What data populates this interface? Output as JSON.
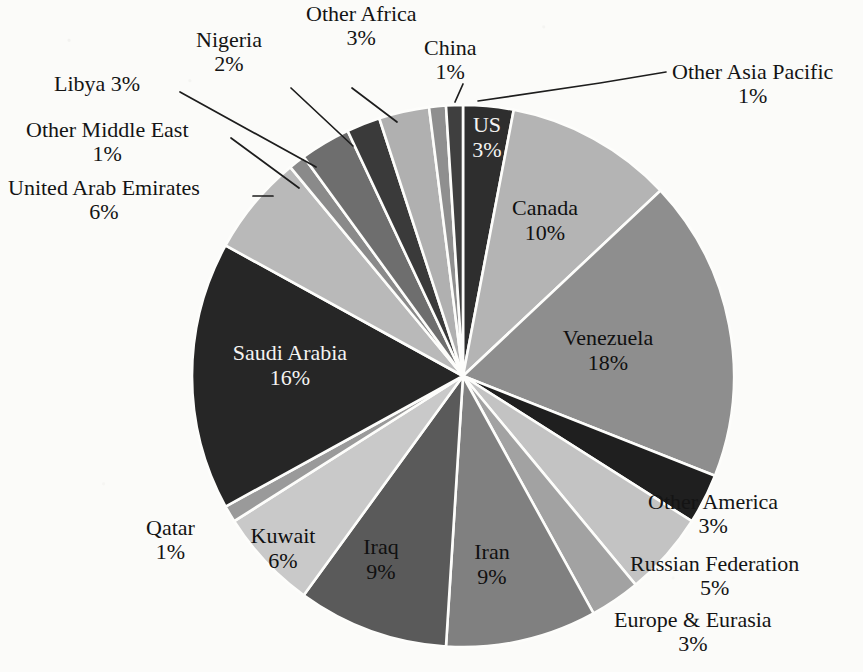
{
  "chart_data": {
    "type": "pie",
    "title": "",
    "subtitle": "",
    "units": "percent of total proved oil reserves",
    "legend_position": "none",
    "grid": false,
    "total": 100,
    "start_angle_deg": 0,
    "direction": "clockwise",
    "categories": [
      "US",
      "Canada",
      "Venezuela",
      "Other America",
      "Russian Federation",
      "Europe & Eurasia",
      "Iran",
      "Iraq",
      "Kuwait",
      "Qatar",
      "Saudi Arabia",
      "United Arab Emirates",
      "Other Middle East",
      "Libya",
      "Nigeria",
      "Other Africa",
      "China",
      "Other Asia Pacific"
    ],
    "values": [
      3,
      10,
      18,
      3,
      5,
      3,
      9,
      9,
      6,
      1,
      16,
      6,
      1,
      3,
      2,
      3,
      1,
      1
    ],
    "slices": [
      {
        "name": "US",
        "label": "US",
        "pct": 3,
        "pct_text": "3%",
        "color": "#2e2e2e",
        "label_placement": "inside",
        "text_color": "light"
      },
      {
        "name": "Canada",
        "label": "Canada",
        "pct": 10,
        "pct_text": "10%",
        "color": "#b4b4b4",
        "label_placement": "inside",
        "text_color": "dark"
      },
      {
        "name": "Venezuela",
        "label": "Venezuela",
        "pct": 18,
        "pct_text": "18%",
        "color": "#8e8e8e",
        "label_placement": "inside",
        "text_color": "dark"
      },
      {
        "name": "Other America",
        "label": "Other America",
        "pct": 3,
        "pct_text": "3%",
        "color": "#1f1f1f",
        "label_placement": "outside",
        "text_color": "dark"
      },
      {
        "name": "Russian Federation",
        "label": "Russian Federation",
        "pct": 5,
        "pct_text": "5%",
        "color": "#c3c3c3",
        "label_placement": "outside",
        "text_color": "dark"
      },
      {
        "name": "Europe & Eurasia",
        "label": "Europe & Eurasia",
        "pct": 3,
        "pct_text": "3%",
        "color": "#a2a2a2",
        "label_placement": "outside",
        "text_color": "dark"
      },
      {
        "name": "Iran",
        "label": "Iran",
        "pct": 9,
        "pct_text": "9%",
        "color": "#808080",
        "label_placement": "inside",
        "text_color": "dark"
      },
      {
        "name": "Iraq",
        "label": "Iraq",
        "pct": 9,
        "pct_text": "9%",
        "color": "#5a5a5a",
        "label_placement": "inside",
        "text_color": "dark"
      },
      {
        "name": "Kuwait",
        "label": "Kuwait",
        "pct": 6,
        "pct_text": "6%",
        "color": "#c9c9c9",
        "label_placement": "inside",
        "text_color": "dark"
      },
      {
        "name": "Qatar",
        "label": "Qatar",
        "pct": 1,
        "pct_text": "1%",
        "color": "#9a9a9a",
        "label_placement": "outside",
        "text_color": "dark"
      },
      {
        "name": "Saudi Arabia",
        "label": "Saudi Arabia",
        "pct": 16,
        "pct_text": "16%",
        "color": "#262626",
        "label_placement": "inside",
        "text_color": "light"
      },
      {
        "name": "United Arab Emirates",
        "label": "United Arab Emirates",
        "pct": 6,
        "pct_text": "6%",
        "color": "#b9b9b9",
        "label_placement": "outside",
        "text_color": "dark"
      },
      {
        "name": "Other Middle East",
        "label": "Other Middle East",
        "pct": 1,
        "pct_text": "1%",
        "color": "#8a8a8a",
        "label_placement": "outside",
        "text_color": "dark"
      },
      {
        "name": "Libya",
        "label": "Libya",
        "pct": 3,
        "pct_text": "3%",
        "color": "#6e6e6e",
        "label_placement": "outside",
        "text_color": "dark"
      },
      {
        "name": "Nigeria",
        "label": "Nigeria",
        "pct": 2,
        "pct_text": "2%",
        "color": "#3a3a3a",
        "label_placement": "outside",
        "text_color": "dark"
      },
      {
        "name": "Other Africa",
        "label": "Other Africa",
        "pct": 3,
        "pct_text": "3%",
        "color": "#b0b0b0",
        "label_placement": "outside",
        "text_color": "dark"
      },
      {
        "name": "China",
        "label": "China",
        "pct": 1,
        "pct_text": "1%",
        "color": "#8f8f8f",
        "label_placement": "outside",
        "text_color": "dark"
      },
      {
        "name": "Other Asia Pacific",
        "label": "Other Asia Pacific",
        "pct": 1,
        "pct_text": "1%",
        "color": "#3f3f3f",
        "label_placement": "outside",
        "text_color": "dark"
      }
    ]
  },
  "geometry": {
    "center_x": 463,
    "center_y": 376,
    "radius": 271
  },
  "colors": {
    "background": "#fbfbf9",
    "slice_outline": "#fdfdfb",
    "leader_line": "#1d1d1d",
    "label_text": "#141414",
    "label_text_on_dark": "#f4f4f2"
  },
  "labels_outside": [
    {
      "name": "other-asia-pacific",
      "line1": "Other Asia Pacific",
      "line2": "1%",
      "left": 672,
      "top": 60,
      "anchor": "left",
      "leader": [
        [
          478,
          101
        ],
        [
          600,
          83
        ],
        [
          666,
          72
        ]
      ]
    },
    {
      "name": "china",
      "line1": "China",
      "line2": "1%",
      "left": 424,
      "top": 36,
      "anchor": "center",
      "leader": [
        [
          455,
          102
        ],
        [
          463,
          84
        ]
      ]
    },
    {
      "name": "other-africa",
      "line1": "Other Africa",
      "line2": "3%",
      "left": 306,
      "top": 2,
      "anchor": "center",
      "leader": [
        [
          397,
          122
        ],
        [
          352,
          88
        ]
      ]
    },
    {
      "name": "nigeria",
      "line1": "Nigeria",
      "line2": "2%",
      "left": 196,
      "top": 28,
      "anchor": "center",
      "leader": [
        [
          353,
          146
        ],
        [
          291,
          88
        ]
      ]
    },
    {
      "name": "libya",
      "line1": "Libya 3%",
      "line2": "",
      "left": 54,
      "top": 72,
      "anchor": "left-inline",
      "leader": [
        [
          316,
          167
        ],
        [
          180,
          92
        ]
      ]
    },
    {
      "name": "other-middle-east",
      "line1": "Other Middle East",
      "line2": "1%",
      "left": 26,
      "top": 118,
      "anchor": "left-inline",
      "leader": [
        [
          299,
          188
        ],
        [
          231,
          138
        ]
      ]
    },
    {
      "name": "united-arab-emirates",
      "line1": "United Arab Emirates",
      "line2": "6%",
      "left": 8,
      "top": 176,
      "anchor": "left-inline",
      "leader": [
        [
          273,
          196
        ],
        [
          253,
          196
        ]
      ]
    },
    {
      "name": "other-america",
      "line1": "Other America",
      "line2": "3%",
      "left": 648,
      "top": 490,
      "anchor": "left"
    },
    {
      "name": "russian-federation",
      "line1": "Russian Federation",
      "line2": "5%",
      "left": 630,
      "top": 552,
      "anchor": "left"
    },
    {
      "name": "europe-eurasia",
      "line1": "Europe & Eurasia",
      "line2": "3%",
      "left": 614,
      "top": 608,
      "anchor": "left"
    },
    {
      "name": "qatar",
      "line1": "Qatar",
      "line2": "1%",
      "left": 146,
      "top": 516,
      "anchor": "center"
    }
  ],
  "labels_inside": [
    {
      "name": "us",
      "line1": "US",
      "line2": "3%",
      "x": 487,
      "y": 138,
      "tone": "dark-bg"
    },
    {
      "name": "canada",
      "line1": "Canada",
      "line2": "10%",
      "x": 545,
      "y": 221,
      "tone": "light-bg"
    },
    {
      "name": "venezuela",
      "line1": "Venezuela",
      "line2": "18%",
      "x": 608,
      "y": 351,
      "tone": "light-bg"
    },
    {
      "name": "iran",
      "line1": "Iran",
      "line2": "9%",
      "x": 492,
      "y": 565,
      "tone": "light-bg"
    },
    {
      "name": "iraq",
      "line1": "Iraq",
      "line2": "9%",
      "x": 381,
      "y": 560,
      "tone": "light-bg"
    },
    {
      "name": "kuwait",
      "line1": "Kuwait",
      "line2": "6%",
      "x": 283,
      "y": 549,
      "tone": "light-bg"
    },
    {
      "name": "saudi-arabia",
      "line1": "Saudi Arabia",
      "line2": "16%",
      "x": 290,
      "y": 366,
      "tone": "dark-bg"
    }
  ]
}
